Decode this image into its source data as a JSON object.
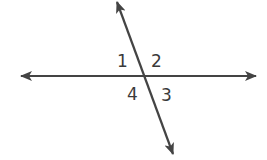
{
  "diagram": {
    "type": "intersecting-lines",
    "line_color": "#444444",
    "label_color": "#3a3a3a",
    "background": "#ffffff",
    "lines": [
      {
        "name": "horizontal",
        "from": [
          20,
          76
        ],
        "to": [
          257,
          76
        ],
        "arrows": "both"
      },
      {
        "name": "transversal",
        "from": [
          116,
          1
        ],
        "to": [
          174,
          155
        ],
        "arrows": "both"
      }
    ],
    "intersection": [
      144,
      76
    ],
    "angle_labels": [
      {
        "id": "1",
        "text": "1",
        "x": 117,
        "y": 67
      },
      {
        "id": "2",
        "text": "2",
        "x": 151,
        "y": 67
      },
      {
        "id": "4",
        "text": "4",
        "x": 127,
        "y": 100
      },
      {
        "id": "3",
        "text": "3",
        "x": 161,
        "y": 101
      }
    ]
  }
}
